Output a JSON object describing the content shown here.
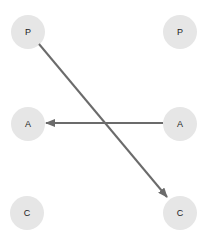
{
  "diagram": {
    "nodes": [
      {
        "id": "p-left",
        "label": "P",
        "x": 28,
        "y": 32
      },
      {
        "id": "p-right",
        "label": "P",
        "x": 180,
        "y": 32
      },
      {
        "id": "a-left",
        "label": "A",
        "x": 28,
        "y": 124
      },
      {
        "id": "a-right",
        "label": "A",
        "x": 180,
        "y": 124
      },
      {
        "id": "c-left",
        "label": "C",
        "x": 27,
        "y": 213
      },
      {
        "id": "c-right",
        "label": "C",
        "x": 180,
        "y": 213
      }
    ],
    "edges": [
      {
        "from": "p-left",
        "to": "c-right"
      },
      {
        "from": "a-right",
        "to": "a-left"
      }
    ],
    "colors": {
      "node": "#e6e6e6",
      "edge": "#6b6b6b",
      "text": "#222222"
    }
  }
}
